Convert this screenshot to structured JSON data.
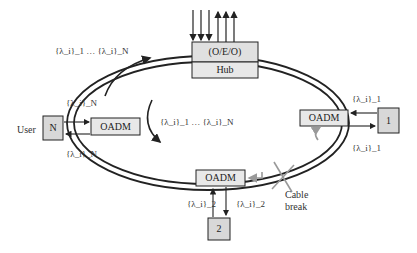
{
  "diagram": {
    "hub": {
      "top_label": "(O/E/O)",
      "bottom_label": "Hub"
    },
    "nodes": {
      "left_oadm": "OADM",
      "right_oadm": "OADM",
      "bottom_oadm": "OADM",
      "user_box": "N",
      "node1_box": "1",
      "node2_box": "2"
    },
    "labels": {
      "user": "User",
      "outer_wavelengths": "{λ_i}_1 … {λ_i}_N",
      "inner_wavelengths": "{λ_i}_1 … {λ_i}_N",
      "left_top": "{λ_i}_N",
      "left_bottom": "{λ_i}_N",
      "right_top": "{λ_i}_1",
      "right_bottom": "{λ_i}_1",
      "bottom_left": "{λ_i}_2",
      "bottom_right": "{λ_i}_2",
      "cable_break_line1": "Cable",
      "cable_break_line2": "break"
    },
    "colors": {
      "box_fill": "#e0e0e0",
      "line": "#222222",
      "break_mark": "#999999"
    }
  }
}
